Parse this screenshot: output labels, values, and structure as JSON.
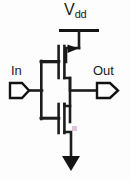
{
  "diagram": {
    "type": "circuit-schematic",
    "background_color": "#fdfdfd",
    "line_color": "#1c1c1c",
    "labels": {
      "vdd_main": "V",
      "vdd_subscript": "dd",
      "input": "In",
      "output": "Out"
    },
    "nodes": [
      {
        "name": "vdd-rail",
        "label": "Vdd",
        "kind": "supply-rail"
      },
      {
        "name": "pmos-transistor",
        "label": "",
        "kind": "pmos"
      },
      {
        "name": "nmos-transistor",
        "label": "",
        "kind": "nmos"
      },
      {
        "name": "ground-arrow",
        "label": "",
        "kind": "ground"
      },
      {
        "name": "input-port",
        "label": "In",
        "kind": "port"
      },
      {
        "name": "output-port",
        "label": "Out",
        "kind": "port"
      }
    ],
    "connections": [
      {
        "from": "vdd-rail",
        "to": "pmos-transistor"
      },
      {
        "from": "pmos-transistor",
        "to": "output-port"
      },
      {
        "from": "nmos-transistor",
        "to": "output-port"
      },
      {
        "from": "nmos-transistor",
        "to": "ground-arrow"
      },
      {
        "from": "input-port",
        "to": "pmos-transistor"
      },
      {
        "from": "input-port",
        "to": "nmos-transistor"
      }
    ]
  }
}
